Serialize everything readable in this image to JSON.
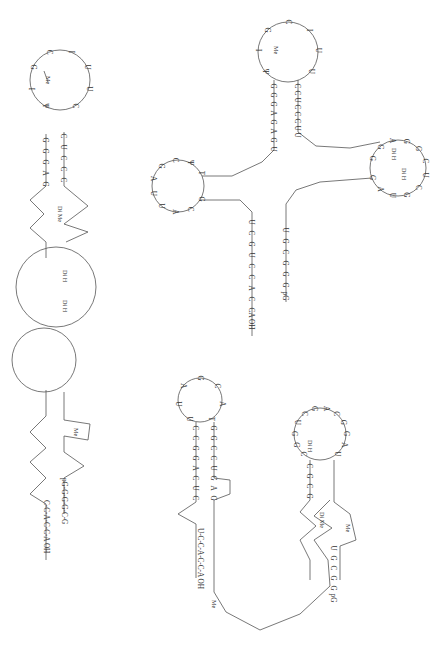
{
  "figure": {
    "colors": {
      "ink": "#333333",
      "line": "#555555",
      "background": "#ffffff"
    }
  },
  "models": [
    {
      "id": "hairpin",
      "label": "extended hairpin model (left)",
      "sequence_5prime_label": "pG",
      "sequence_3prime_label": "A OH",
      "top_loop": {
        "cx": 62,
        "cy": 80,
        "r": 30,
        "nucleotides": [
          "Ψ",
          "I",
          "G",
          "C",
          "I",
          "U",
          "U",
          "C"
        ],
        "modifications": [
          {
            "text": "Me",
            "x": 50,
            "y": 85
          }
        ]
      },
      "left_strand": [
        "G",
        "G",
        "G",
        "A",
        "G",
        "A",
        "G",
        "Ψ",
        "G",
        "C",
        "C",
        "U",
        "G",
        "G",
        "C",
        "A",
        "G",
        "C",
        "G",
        "G",
        "A",
        "G",
        "G",
        "C",
        "C",
        "A",
        "C",
        "C",
        "G",
        "G",
        "C",
        "C",
        "A",
        "C",
        "C",
        "A"
      ],
      "right_strand": [
        "C",
        "U",
        "C",
        "C",
        "C",
        "G",
        "C",
        "G",
        "C",
        "A",
        "G",
        "U",
        "C",
        "G",
        "C",
        "C",
        "U",
        "G",
        "G",
        "U",
        "A",
        "G",
        "C",
        "C",
        "G",
        "C",
        "G",
        "U",
        "G",
        "G",
        "G",
        "G",
        "pG"
      ],
      "labels": {
        "me_di": "Di Me",
        "dih1": "Di H",
        "dih2": "Di H",
        "me_low": "Me",
        "end3": "C-C-A-C-C-A OH",
        "end5": "pG-G-G-G-C-G"
      }
    },
    {
      "id": "cloverleaf",
      "label": "cloverleaf model (top right)",
      "anticodon_arm": [
        "G",
        "G",
        "G",
        "A",
        "G",
        "A",
        "G",
        "U",
        "C",
        "C",
        "U",
        "C",
        "C",
        "C",
        "U",
        "U"
      ],
      "anticodon_loop": [
        "Ψ",
        "I",
        "G",
        "C",
        "I",
        "U",
        "U"
      ],
      "d_arm_loop": [
        "G",
        "C",
        "A",
        "U",
        "U",
        "A",
        "G",
        "C",
        "Ψ",
        "T"
      ],
      "t_arm_loop": [
        "G",
        "G",
        "A",
        "G",
        "G",
        "C",
        "U",
        "C",
        "G",
        "U",
        "A",
        "G"
      ],
      "acceptor_3prime": [
        "U",
        "C",
        "G",
        "U",
        "C",
        "C",
        "A",
        "C",
        "C",
        "A OH"
      ],
      "acceptor_5prime": [
        "pG",
        "G",
        "G",
        "G",
        "C",
        "G",
        "U"
      ],
      "labels": {
        "me": "Me",
        "di_h_1": "Di H",
        "di_h_2": "Di H",
        "me_g": "MeG",
        "me_c": "MeC"
      }
    },
    {
      "id": "alternative",
      "label": "alternative fold (bottom right)",
      "anticodon_loop": [
        "U",
        "U",
        "A",
        "G",
        "C",
        "A",
        "T"
      ],
      "left_stem": [
        "C",
        "C",
        "G",
        "G",
        "A",
        "C",
        "U",
        "C"
      ],
      "right_stem": [
        "G",
        "G",
        "C",
        "C",
        "U",
        "G",
        "A",
        "G"
      ],
      "bottom_loop": [
        "A",
        "G",
        "G",
        "A",
        "G",
        "G",
        "G",
        "Ψ",
        "I",
        "C",
        "C",
        "U",
        "G",
        "I",
        "C",
        "U"
      ],
      "right_arm_loop": [
        "C",
        "G",
        "G",
        "U",
        "C",
        "G",
        "A",
        "C",
        "G",
        "G",
        "A",
        "U"
      ],
      "right_stem_lower": [
        "C",
        "G",
        "C",
        "G",
        "C",
        "C",
        "G",
        "C"
      ],
      "acceptor_5prime": [
        "pG",
        "G",
        "G",
        "C",
        "G",
        "U"
      ],
      "end3": "U-C-C-A-C-C-A OH",
      "labels": {
        "me": "Me",
        "di_h": "Di H",
        "di_me": "Di Me",
        "me2": "Me"
      }
    }
  ]
}
